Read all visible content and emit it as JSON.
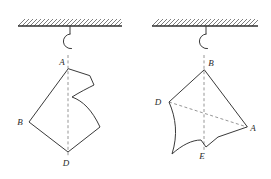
{
  "figure": {
    "stroke_color": "#3a3a3a",
    "dash_color": "#8a8a8a",
    "ceiling_color": "#2f2f2f",
    "background": "#ffffff"
  },
  "panels": [
    {
      "id": "left-panel",
      "ceiling": {
        "x1": 18,
        "y1": 26,
        "x2": 122,
        "y2": 26,
        "hatch_count": 26,
        "hatch_height": 7
      },
      "hook": {
        "stem_x": 70,
        "stem_top": 26,
        "stem_bottom": 33,
        "loop_cx": 67,
        "loop_cy": 40,
        "loop_r": 7.5
      },
      "dashed_axis": {
        "x1": 68,
        "y1": 55,
        "x2": 68,
        "y2": 156
      },
      "outline": "M 68 69 L 29 122 L 68 152 L 100 127 C 92 110 83 101 72 97 C 80 92 88 88 94 85 L 90 76 Z",
      "labels": [
        {
          "name": "vertex-label-a",
          "text": "A",
          "x": 62,
          "y": 65
        },
        {
          "name": "vertex-label-b",
          "text": "B",
          "x": 20,
          "y": 125
        },
        {
          "name": "vertex-label-d",
          "text": "D",
          "x": 64,
          "y": 166
        }
      ]
    },
    {
      "id": "right-panel",
      "ceiling": {
        "x1": 152,
        "y1": 26,
        "x2": 258,
        "y2": 26,
        "hatch_count": 26,
        "hatch_height": 7
      },
      "hook": {
        "stem_x": 206,
        "stem_top": 26,
        "stem_bottom": 33,
        "loop_cx": 203,
        "loop_cy": 40,
        "loop_r": 7.5
      },
      "dashed_axis": {
        "x1": 204,
        "y1": 55,
        "x2": 204,
        "y2": 152
      },
      "dashed_diagonals": [
        {
          "x1": 169,
          "y1": 102,
          "x2": 247,
          "y2": 127
        }
      ],
      "outline": "M 204 70 L 169 102 C 176 118 178 135 172 154 C 182 145 192 140 201 140 L 206 147 L 218 137 L 247 127 Z",
      "labels": [
        {
          "name": "vertex-label-b",
          "text": "B",
          "x": 209,
          "y": 66
        },
        {
          "name": "vertex-label-d",
          "text": "D",
          "x": 156,
          "y": 104
        },
        {
          "name": "vertex-label-a",
          "text": "A",
          "x": 251,
          "y": 131
        },
        {
          "name": "vertex-label-e",
          "text": "E",
          "x": 201,
          "y": 158
        }
      ]
    }
  ]
}
